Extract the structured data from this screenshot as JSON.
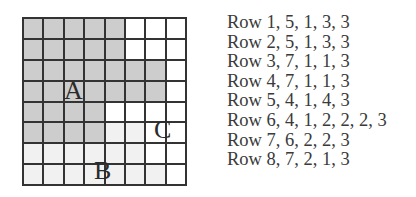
{
  "grid": {
    "columns": 8,
    "rows": 8,
    "colors": {
      "1": "#cdcdcd",
      "2": "#f1f1f1",
      "3": "#ffffff",
      "line": "#333333"
    },
    "region_labels": {
      "a": "A",
      "b": "B",
      "c": "C"
    },
    "legend": {
      "1": "A",
      "2": "B",
      "3": "C"
    }
  },
  "encoding": [
    {
      "label": "Row 1, 5, 1, 3, 3",
      "row": 1,
      "runs": [
        [
          5,
          1
        ],
        [
          3,
          3
        ]
      ]
    },
    {
      "label": "Row 2, 5, 1, 3, 3",
      "row": 2,
      "runs": [
        [
          5,
          1
        ],
        [
          3,
          3
        ]
      ]
    },
    {
      "label": "Row 3, 7, 1, 1, 3",
      "row": 3,
      "runs": [
        [
          7,
          1
        ],
        [
          1,
          3
        ]
      ]
    },
    {
      "label": "Row 4, 7, 1, 1, 3",
      "row": 4,
      "runs": [
        [
          7,
          1
        ],
        [
          1,
          3
        ]
      ]
    },
    {
      "label": "Row 5, 4, 1, 4, 3",
      "row": 5,
      "runs": [
        [
          4,
          1
        ],
        [
          4,
          3
        ]
      ]
    },
    {
      "label": "Row 6, 4, 1, 2, 2, 2, 3",
      "row": 6,
      "runs": [
        [
          4,
          1
        ],
        [
          2,
          2
        ],
        [
          2,
          3
        ]
      ]
    },
    {
      "label": "Row 7, 6, 2, 2, 3",
      "row": 7,
      "runs": [
        [
          6,
          2
        ],
        [
          2,
          3
        ]
      ]
    },
    {
      "label": "Row 8, 7, 2, 1, 3",
      "row": 8,
      "runs": [
        [
          7,
          2
        ],
        [
          1,
          3
        ]
      ]
    }
  ]
}
